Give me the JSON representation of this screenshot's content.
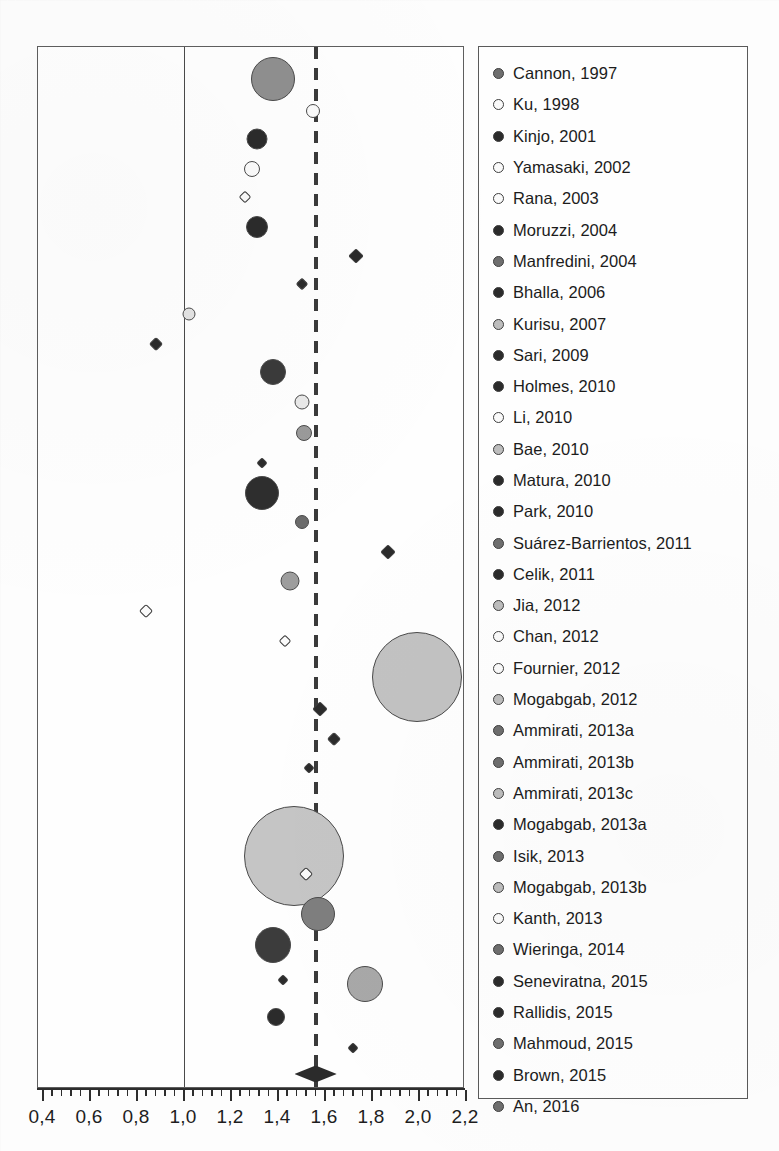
{
  "chart_data": {
    "type": "scatter",
    "title": "",
    "xlabel": "",
    "ylabel": "",
    "xlim": [
      0.4,
      2.2
    ],
    "grid": false,
    "legend_position": "right",
    "decimal_separator": ",",
    "axis": {
      "tick_labels": [
        "0,4",
        "0,6",
        "0,8",
        "1,0",
        "1,2",
        "1,4",
        "1,6",
        "1,8",
        "2,0",
        "2,2"
      ],
      "tick_values": [
        0.4,
        0.6,
        0.8,
        1.0,
        1.2,
        1.4,
        1.6,
        1.8,
        2.0,
        2.2
      ],
      "minor_ticks_per_major": 4
    },
    "reference_lines": [
      {
        "name": "null-effect-line",
        "value": 1.0,
        "style": "solid"
      },
      {
        "name": "pooled-estimate-line",
        "value": 1.56,
        "style": "dashed"
      }
    ],
    "summary": {
      "name": "pooled-summary-diamond",
      "value": 1.56,
      "ci_low": 1.47,
      "ci_high": 1.65,
      "shape": "diamond"
    },
    "colors": {
      "dark_marker": "#2b2b2b",
      "mid_marker": "#6e6e6e",
      "light_marker": "#bdbdbd",
      "open_marker": "#fafafa",
      "outline": "#4a4a4a",
      "axis": "#2d2d2d",
      "frame": "#5e5e5e"
    },
    "series_name": "Included studies",
    "points": [
      {
        "label": "Cannon, 1997",
        "x": 1.38,
        "y": 78,
        "r": 22,
        "fill": "#8f8f8f"
      },
      {
        "label": "Ku, 1998",
        "x": 1.55,
        "y": 110,
        "r": 7,
        "fill": "#fafafa"
      },
      {
        "label": "Kinjo, 2001",
        "x": 1.31,
        "y": 138,
        "r": 10.5,
        "fill": "#2b2b2b"
      },
      {
        "label": "Yamasaki, 2002",
        "x": 1.29,
        "y": 168,
        "r": 8,
        "fill": "#fafafa"
      },
      {
        "label": "Rana, 2003",
        "x": 1.26,
        "y": 196,
        "r": 4.5,
        "fill": "#fafafa"
      },
      {
        "label": "Moruzzi, 2004",
        "x": 1.31,
        "y": 226,
        "r": 11,
        "fill": "#2b2b2b"
      },
      {
        "label": "Manfredini, 2004",
        "x": 1.73,
        "y": 255,
        "r": 5.5,
        "fill": "#2b2b2b"
      },
      {
        "label": "Bhalla, 2006",
        "x": 1.5,
        "y": 283,
        "r": 4.5,
        "fill": "#2b2b2b"
      },
      {
        "label": "Kurisu, 2007",
        "x": 1.02,
        "y": 313,
        "r": 6.5,
        "fill": "#e2e2e2"
      },
      {
        "label": "Sari, 2009",
        "x": 0.88,
        "y": 343,
        "r": 5,
        "fill": "#2b2b2b"
      },
      {
        "label": "Holmes, 2010",
        "x": 1.38,
        "y": 371,
        "r": 13,
        "fill": "#3a3a3a"
      },
      {
        "label": "Li, 2010",
        "x": 1.5,
        "y": 401,
        "r": 7.5,
        "fill": "#e8e8e8"
      },
      {
        "label": "Bae, 2010",
        "x": 1.51,
        "y": 432,
        "r": 8,
        "fill": "#9a9a9a"
      },
      {
        "label": "Matura, 2010",
        "x": 1.33,
        "y": 462,
        "r": 4,
        "fill": "#2b2b2b"
      },
      {
        "label": "Park, 2010",
        "x": 1.33,
        "y": 492,
        "r": 17,
        "fill": "#2e2e2e"
      },
      {
        "label": "Suárez-Barrientos, 2011",
        "x": 1.5,
        "y": 521,
        "r": 7,
        "fill": "#6b6b6b"
      },
      {
        "label": "Celik, 2011",
        "x": 1.87,
        "y": 551,
        "r": 5.5,
        "fill": "#2b2b2b"
      },
      {
        "label": "Jia, 2012",
        "x": 1.45,
        "y": 580,
        "r": 9.5,
        "fill": "#9d9d9d"
      },
      {
        "label": "Chan, 2012",
        "x": 0.84,
        "y": 610,
        "r": 5,
        "fill": "#fafafa"
      },
      {
        "label": "Fournier, 2012",
        "x": 1.43,
        "y": 640,
        "r": 4.5,
        "fill": "#fafafa"
      },
      {
        "label": "Mogabgab, 2012",
        "x": 1.99,
        "y": 676,
        "r": 45,
        "fill": "#c2c2c2"
      },
      {
        "label": "Ammirati, 2013a",
        "x": 1.58,
        "y": 708,
        "r": 5.5,
        "fill": "#2b2b2b"
      },
      {
        "label": "Ammirati, 2013b",
        "x": 1.64,
        "y": 738,
        "r": 5,
        "fill": "#2b2b2b"
      },
      {
        "label": "Ammirati, 2013c",
        "x": 1.53,
        "y": 767,
        "r": 4,
        "fill": "#2b2b2b"
      },
      {
        "label": "Mogabgab, 2013a",
        "x": 1.47,
        "y": 855,
        "r": 50,
        "fill": "#c5c5c5"
      },
      {
        "label": "Isik, 2013",
        "x": 1.52,
        "y": 873,
        "r": 5,
        "fill": "#fafafa"
      },
      {
        "label": "Mogabgab, 2013b",
        "x": 1.57,
        "y": 913,
        "r": 17,
        "fill": "#7e7e7e"
      },
      {
        "label": "Kanth, 2013",
        "x": 1.38,
        "y": 944,
        "r": 18,
        "fill": "#3c3c3c"
      },
      {
        "label": "Wieringa, 2014",
        "x": 1.42,
        "y": 979,
        "r": 4,
        "fill": "#2b2b2b"
      },
      {
        "label": "Seneviratna, 2015",
        "x": 1.77,
        "y": 983,
        "r": 18,
        "fill": "#a8a8a8"
      },
      {
        "label": "Rallidis, 2015",
        "x": 1.39,
        "y": 1016,
        "r": 9,
        "fill": "#2b2b2b"
      },
      {
        "label": "Brown, 2015",
        "x": 1.72,
        "y": 1047,
        "r": 4,
        "fill": "#2b2b2b"
      },
      {
        "label": "An, 2016",
        "x": 1.56,
        "y": 1073,
        "r": 0,
        "fill": "#2b2b2b"
      }
    ]
  },
  "legend": {
    "items": [
      {
        "label": "Cannon, 1997",
        "marker": "mid"
      },
      {
        "label": "Ku, 1998",
        "marker": "open"
      },
      {
        "label": "Kinjo, 2001",
        "marker": "dark"
      },
      {
        "label": "Yamasaki, 2002",
        "marker": "open"
      },
      {
        "label": "Rana, 2003",
        "marker": "open"
      },
      {
        "label": "Moruzzi, 2004",
        "marker": "dark"
      },
      {
        "label": "Manfredini, 2004",
        "marker": "mid"
      },
      {
        "label": "Bhalla, 2006",
        "marker": "dark"
      },
      {
        "label": "Kurisu, 2007",
        "marker": "light"
      },
      {
        "label": "Sari, 2009",
        "marker": "dark"
      },
      {
        "label": "Holmes, 2010",
        "marker": "dark"
      },
      {
        "label": "Li, 2010",
        "marker": "open"
      },
      {
        "label": "Bae, 2010",
        "marker": "light"
      },
      {
        "label": "Matura, 2010",
        "marker": "dark"
      },
      {
        "label": "Park, 2010",
        "marker": "dark"
      },
      {
        "label": "Suárez-Barrientos, 2011",
        "marker": "mid"
      },
      {
        "label": "Celik, 2011",
        "marker": "dark"
      },
      {
        "label": "Jia, 2012",
        "marker": "light"
      },
      {
        "label": "Chan, 2012",
        "marker": "open"
      },
      {
        "label": "Fournier, 2012",
        "marker": "open"
      },
      {
        "label": "Mogabgab, 2012",
        "marker": "light"
      },
      {
        "label": "Ammirati, 2013a",
        "marker": "mid"
      },
      {
        "label": "Ammirati, 2013b",
        "marker": "mid"
      },
      {
        "label": "Ammirati, 2013c",
        "marker": "light"
      },
      {
        "label": "Mogabgab, 2013a",
        "marker": "dark"
      },
      {
        "label": "Isik, 2013",
        "marker": "mid"
      },
      {
        "label": "Mogabgab, 2013b",
        "marker": "light"
      },
      {
        "label": "Kanth, 2013",
        "marker": "open"
      },
      {
        "label": "Wieringa, 2014",
        "marker": "mid"
      },
      {
        "label": "Seneviratna, 2015",
        "marker": "dark"
      },
      {
        "label": "Rallidis, 2015",
        "marker": "dark"
      },
      {
        "label": "Mahmoud, 2015",
        "marker": "mid"
      },
      {
        "label": "Brown, 2015",
        "marker": "dark"
      },
      {
        "label": "An, 2016",
        "marker": "mid"
      }
    ]
  }
}
